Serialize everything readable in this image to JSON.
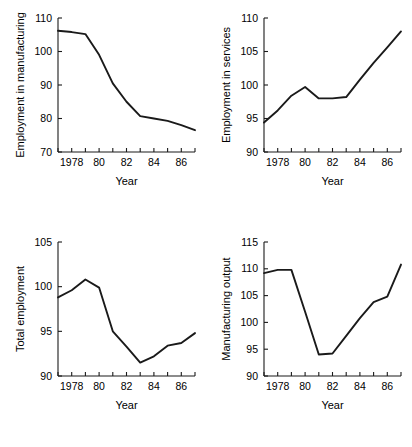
{
  "figure": {
    "background": "#ffffff",
    "line_color": "#1a1a1a",
    "axis_color": "#1a1a1a",
    "panel_count": 4
  },
  "chart_data": [
    {
      "id": "employment-in-manufacturing",
      "type": "line",
      "title": "",
      "xlabel": "Year",
      "ylabel": "Employment in manufacturing",
      "xlim": [
        1977,
        1987
      ],
      "ylim": [
        70,
        110
      ],
      "yticks": [
        70,
        80,
        90,
        100,
        110
      ],
      "ytick_labels": [
        "70",
        "80",
        "90",
        "100",
        "110"
      ],
      "xticks": [
        1977,
        1978,
        1979,
        1980,
        1981,
        1982,
        1983,
        1984,
        1985,
        1986,
        1987
      ],
      "xtick_labels": [
        "",
        "1978",
        "",
        "80",
        "",
        "82",
        "",
        "84",
        "",
        "86",
        ""
      ],
      "grid": false,
      "legend": "none",
      "x": [
        1977,
        1978,
        1979,
        1980,
        1981,
        1982,
        1983,
        1984,
        1985,
        1986,
        1987
      ],
      "values": [
        106.2,
        105.8,
        105.2,
        99.0,
        90.5,
        85.0,
        80.7,
        80.0,
        79.3,
        78.0,
        76.5
      ]
    },
    {
      "id": "employment-in-services",
      "type": "line",
      "title": "",
      "xlabel": "Year",
      "ylabel": "Employment in services",
      "xlim": [
        1977,
        1987
      ],
      "ylim": [
        90,
        110
      ],
      "yticks": [
        90,
        95,
        100,
        105,
        110
      ],
      "ytick_labels": [
        "90",
        "95",
        "100",
        "105",
        "110"
      ],
      "xticks": [
        1977,
        1978,
        1979,
        1980,
        1981,
        1982,
        1983,
        1984,
        1985,
        1986,
        1987
      ],
      "xtick_labels": [
        "",
        "1978",
        "",
        "80",
        "",
        "82",
        "",
        "84",
        "",
        "86",
        ""
      ],
      "grid": false,
      "legend": "none",
      "x": [
        1977,
        1978,
        1979,
        1980,
        1981,
        1982,
        1983,
        1984,
        1985,
        1986,
        1987
      ],
      "values": [
        94.4,
        96.2,
        98.4,
        99.7,
        98.0,
        98.0,
        98.2,
        100.8,
        103.3,
        105.6,
        108.0
      ]
    },
    {
      "id": "total-employment",
      "type": "line",
      "title": "",
      "xlabel": "Year",
      "ylabel": "Total employment",
      "xlim": [
        1977,
        1987
      ],
      "ylim": [
        90,
        105
      ],
      "yticks": [
        90,
        95,
        100,
        105
      ],
      "ytick_labels": [
        "90",
        "95",
        "100",
        "105"
      ],
      "xticks": [
        1977,
        1978,
        1979,
        1980,
        1981,
        1982,
        1983,
        1984,
        1985,
        1986,
        1987
      ],
      "xtick_labels": [
        "",
        "1978",
        "",
        "80",
        "",
        "82",
        "",
        "84",
        "",
        "86",
        ""
      ],
      "grid": false,
      "legend": "none",
      "x": [
        1977,
        1978,
        1979,
        1980,
        1981,
        1982,
        1983,
        1984,
        1985,
        1986,
        1987
      ],
      "values": [
        98.8,
        99.6,
        100.8,
        99.9,
        95.0,
        93.3,
        91.5,
        92.2,
        93.4,
        93.7,
        94.8
      ]
    },
    {
      "id": "manufacturing-output",
      "type": "line",
      "title": "",
      "xlabel": "Year",
      "ylabel": "Manufacturing output",
      "xlim": [
        1977,
        1987
      ],
      "ylim": [
        90,
        115
      ],
      "yticks": [
        90,
        95,
        100,
        105,
        110,
        115
      ],
      "ytick_labels": [
        "90",
        "95",
        "100",
        "105",
        "110",
        "115"
      ],
      "xticks": [
        1977,
        1978,
        1979,
        1980,
        1981,
        1982,
        1983,
        1984,
        1985,
        1986,
        1987
      ],
      "xtick_labels": [
        "",
        "1978",
        "",
        "80",
        "",
        "82",
        "",
        "84",
        "",
        "86",
        ""
      ],
      "grid": false,
      "legend": "none",
      "x": [
        1977,
        1978,
        1979,
        1980,
        1981,
        1982,
        1983,
        1984,
        1985,
        1986,
        1987
      ],
      "values": [
        109.2,
        109.8,
        109.8,
        102.0,
        94.0,
        94.2,
        97.5,
        100.8,
        103.8,
        104.8,
        110.8
      ]
    }
  ]
}
